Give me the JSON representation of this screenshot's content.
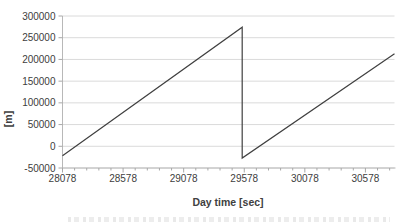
{
  "chart_data": {
    "type": "line",
    "title": "",
    "xlabel": "Day time [sec]",
    "ylabel": "[m]",
    "xlim": [
      28078,
      30818
    ],
    "ylim": [
      -50000,
      300000
    ],
    "x_ticks": [
      28078,
      28578,
      29078,
      29578,
      30078,
      30578
    ],
    "x_minor_tick_step": 100,
    "y_ticks": [
      -50000,
      0,
      50000,
      100000,
      150000,
      200000,
      250000,
      300000
    ],
    "grid": "horizontal-major-only",
    "legend": "none",
    "series": [
      {
        "name": "sawtooth-range",
        "color": "#404040",
        "points": [
          [
            28078,
            -22000
          ],
          [
            29561,
            274000
          ],
          [
            29561,
            -27000
          ],
          [
            30818,
            213000
          ]
        ]
      }
    ],
    "colors": {
      "background": "#ffffff",
      "gridline": "#dadada",
      "axis": "#b8b8b8",
      "tick": "#a8a8a8",
      "text": "#404040",
      "line": "#404040"
    }
  }
}
